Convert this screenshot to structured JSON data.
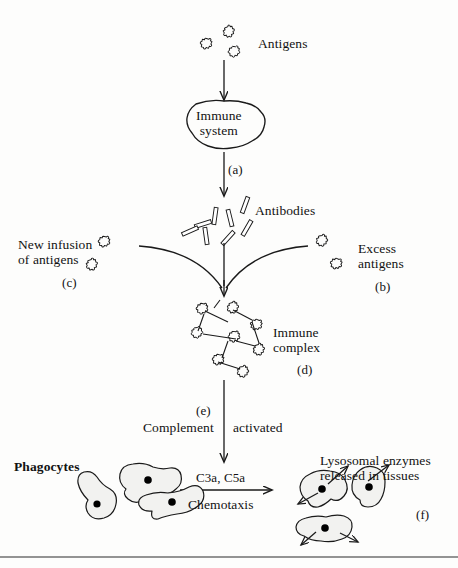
{
  "figure": {
    "title_fragment": "",
    "labels": {
      "antigens": "Antigens",
      "immune_system": "Immune\nsystem",
      "step_a": "(a)",
      "antibodies": "Antibodies",
      "new_infusion": "New infusion\nof antigens",
      "step_c": "(c)",
      "excess_antigens": "Excess\nantigens",
      "step_b": "(b)",
      "immune_complex": "Immune\ncomplex",
      "step_d": "(d)",
      "step_e": "(e)",
      "complement": "Complement",
      "activated": "activated",
      "c3a_c5a": "C3a, C5a",
      "chemotaxis": "Chemotaxis",
      "phagocytes": "Phagocytes",
      "lysosomal": "Lysosomal enzymes\nreleased in tissues",
      "step_f": "(f)"
    },
    "colors": {
      "ink": "#121212",
      "stroke": "#1a1a1a",
      "paper": "#fdfdfc",
      "nucleus": "#000000"
    },
    "flow_steps": [
      {
        "id": "a",
        "from": "Immune system",
        "to": "Antibodies",
        "label": "(a)"
      },
      {
        "id": "b",
        "node": "Excess antigens",
        "label": "(b)"
      },
      {
        "id": "c",
        "node": "New infusion of antigens",
        "label": "(c)"
      },
      {
        "id": "d",
        "node": "Immune complex",
        "label": "(d)"
      },
      {
        "id": "e",
        "node": "Complement activated",
        "label": "(e)"
      },
      {
        "id": "f",
        "node": "Lysosomal enzymes released in tissues",
        "label": "(f)"
      }
    ]
  }
}
